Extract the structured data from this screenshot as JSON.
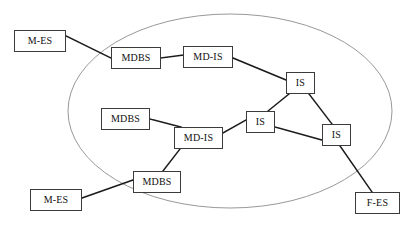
{
  "diagram": {
    "type": "network-topology",
    "canvas": {
      "width": 413,
      "height": 225
    },
    "style": {
      "background_color": "#ffffff",
      "box_fill": "#ffffff",
      "box_border_color": "#3b3b3b",
      "link_color": "#1a1a1a",
      "boundary_color": "#8c8c8c",
      "text_color": "#101010"
    },
    "boundary": {
      "name": "network-boundary-ellipse",
      "shape": "ellipse",
      "cx": 230,
      "cy": 111,
      "rx": 162,
      "ry": 97,
      "stroke": "#8c8c8c",
      "stroke_width": 0.9,
      "fill": "none"
    },
    "nodes": [
      {
        "id": "mes-top-left",
        "label": "M-ES",
        "x": 14,
        "y": 30,
        "w": 52,
        "h": 22,
        "inside_boundary": false
      },
      {
        "id": "mdbs-top",
        "label": "MDBS",
        "x": 111,
        "y": 47,
        "w": 50,
        "h": 22,
        "inside_boundary": true
      },
      {
        "id": "mdis-top",
        "label": "MD-IS",
        "x": 183,
        "y": 46,
        "w": 50,
        "h": 22,
        "inside_boundary": true
      },
      {
        "id": "is-top",
        "label": "IS",
        "x": 286,
        "y": 72,
        "w": 29,
        "h": 22,
        "inside_boundary": true
      },
      {
        "id": "mdbs-middle",
        "label": "MDBS",
        "x": 101,
        "y": 108,
        "w": 49,
        "h": 22,
        "inside_boundary": true
      },
      {
        "id": "mdis-middle",
        "label": "MD-IS",
        "x": 174,
        "y": 127,
        "w": 49,
        "h": 22,
        "inside_boundary": true
      },
      {
        "id": "is-middle",
        "label": "IS",
        "x": 246,
        "y": 111,
        "w": 29,
        "h": 22,
        "inside_boundary": true
      },
      {
        "id": "is-right",
        "label": "IS",
        "x": 322,
        "y": 124,
        "w": 29,
        "h": 22,
        "inside_boundary": true
      },
      {
        "id": "mdbs-bottom",
        "label": "MDBS",
        "x": 133,
        "y": 171,
        "w": 48,
        "h": 22,
        "inside_boundary": true
      },
      {
        "id": "mes-bottom-left",
        "label": "M-ES",
        "x": 30,
        "y": 189,
        "w": 52,
        "h": 22,
        "inside_boundary": false
      },
      {
        "id": "fes-bottom-right",
        "label": "F-ES",
        "x": 355,
        "y": 192,
        "w": 45,
        "h": 22,
        "inside_boundary": false
      }
    ],
    "links": [
      {
        "id": "link-mes-topleft-mdbs-top",
        "from": "mes-top-left",
        "to": "mdbs-top",
        "x1": 66,
        "y1": 36,
        "x2": 111,
        "y2": 58
      },
      {
        "id": "link-mdbs-top-mdis-top",
        "from": "mdbs-top",
        "to": "mdis-top",
        "x1": 161,
        "y1": 58,
        "x2": 183,
        "y2": 55
      },
      {
        "id": "link-mdis-top-is-top",
        "from": "mdis-top",
        "to": "is-top",
        "x1": 233,
        "y1": 58,
        "x2": 286,
        "y2": 80
      },
      {
        "id": "link-is-top-is-middle",
        "from": "is-top",
        "to": "is-middle",
        "x1": 289,
        "y1": 94,
        "x2": 268,
        "y2": 111
      },
      {
        "id": "link-is-top-is-right",
        "from": "is-top",
        "to": "is-right",
        "x1": 309,
        "y1": 94,
        "x2": 332,
        "y2": 124
      },
      {
        "id": "link-is-middle-is-right",
        "from": "is-middle",
        "to": "is-right",
        "x1": 275,
        "y1": 127,
        "x2": 322,
        "y2": 140
      },
      {
        "id": "link-mdis-middle-is-middle",
        "from": "mdis-middle",
        "to": "is-middle",
        "x1": 223,
        "y1": 133,
        "x2": 246,
        "y2": 120
      },
      {
        "id": "link-mdbs-middle-mdis-mid",
        "from": "mdbs-middle",
        "to": "mdis-middle",
        "x1": 150,
        "y1": 119,
        "x2": 181,
        "y2": 127
      },
      {
        "id": "link-mdbs-bottom-mdis-mid",
        "from": "mdbs-bottom",
        "to": "mdis-middle",
        "x1": 163,
        "y1": 171,
        "x2": 180,
        "y2": 149
      },
      {
        "id": "link-mes-bottomleft-mdbs",
        "from": "mes-bottom-left",
        "to": "mdbs-bottom",
        "x1": 82,
        "y1": 198,
        "x2": 133,
        "y2": 180
      },
      {
        "id": "link-is-right-fes",
        "from": "is-right",
        "to": "fes-bottom-right",
        "x1": 340,
        "y1": 146,
        "x2": 372,
        "y2": 192
      }
    ]
  }
}
